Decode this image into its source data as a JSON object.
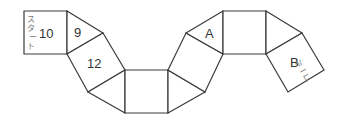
{
  "diagram": {
    "start_label": "スタート",
    "goal_label": "ゴール",
    "cells": [
      {
        "id": "start-square",
        "shape": "square",
        "label": "10"
      },
      {
        "id": "triangle-1",
        "shape": "triangle",
        "label": "9"
      },
      {
        "id": "square-2",
        "shape": "square",
        "label": "12"
      },
      {
        "id": "triangle-2",
        "shape": "triangle",
        "label": ""
      },
      {
        "id": "square-3",
        "shape": "square",
        "label": ""
      },
      {
        "id": "triangle-3",
        "shape": "triangle",
        "label": ""
      },
      {
        "id": "square-4",
        "shape": "square",
        "label": ""
      },
      {
        "id": "triangle-4",
        "shape": "triangle",
        "label": "A"
      },
      {
        "id": "square-5",
        "shape": "square",
        "label": ""
      },
      {
        "id": "triangle-5",
        "shape": "triangle",
        "label": ""
      },
      {
        "id": "goal-square",
        "shape": "square",
        "label": "B"
      }
    ],
    "colors": {
      "line": "#3a3a3a",
      "text": "#333333",
      "kana": "#777777",
      "background": "#ffffff"
    }
  }
}
